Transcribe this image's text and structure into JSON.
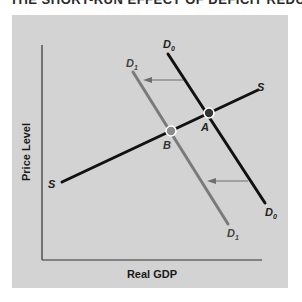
{
  "title": "THE SHORT-RUN EFFECT OF DEFICIT REDUCTION",
  "axes": {
    "x_label": "Real GDP",
    "y_label": "Price Level"
  },
  "curves": {
    "supply": {
      "label_start": "S",
      "label_end": "S"
    },
    "d0": {
      "label_top": "D",
      "label_top_sub": "0",
      "label_bottom": "D",
      "label_bottom_sub": "0"
    },
    "d1": {
      "label_top": "D",
      "label_top_sub": "1",
      "label_bottom": "D",
      "label_bottom_sub": "1"
    }
  },
  "points": {
    "a": "A",
    "b": "B"
  },
  "colors": {
    "background": "#d3d3d3",
    "d0_line": "#111111",
    "d1_line": "#7a7a7a",
    "supply_line": "#111111",
    "arrow": "#6e6e6e",
    "point_fill_a": "#333333",
    "point_fill_b": "#8a8a8a",
    "point_ring": "#ffffff"
  }
}
